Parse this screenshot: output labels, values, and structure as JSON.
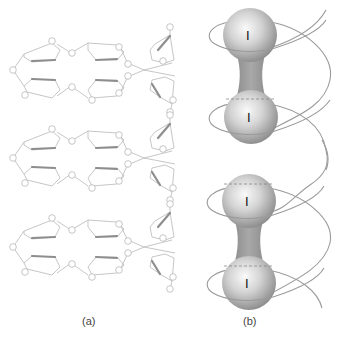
{
  "figure": {
    "panels": [
      {
        "id": "a",
        "label": "(a)",
        "description": "Stacked macrocyclic host molecules (three repeating units) with ring and oxygen-atom circles",
        "units": 3
      },
      {
        "id": "b",
        "label": "(b)",
        "description": "Two I2 (diiodine) molecules as dumbbell spheres threaded by a helical chain",
        "molecules": [
          {
            "atoms": [
              "I",
              "I"
            ]
          },
          {
            "atoms": [
              "I",
              "I"
            ]
          }
        ]
      }
    ],
    "colors": {
      "line": "#b5b5b5",
      "ring_bold": "#8c8c8c",
      "sphere_light": "#f2f2f2",
      "sphere_dark": "#8e8e8e",
      "helix": "#9a9a9a"
    }
  },
  "labels": {
    "a": "(a)",
    "b": "(b)",
    "atom_1": "I",
    "atom_2": "I",
    "atom_3": "I",
    "atom_4": "I"
  }
}
